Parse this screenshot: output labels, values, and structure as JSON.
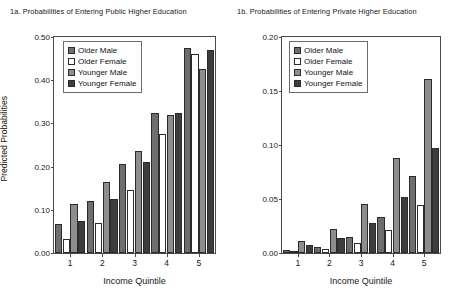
{
  "figure": {
    "xlabel": "Income Quintile",
    "ylabel": "Predicted Probabilities"
  },
  "legend": {
    "entries": [
      {
        "label": "Older Male",
        "fill": "#6e6e6e"
      },
      {
        "label": "Older Female",
        "fill": "#ffffff"
      },
      {
        "label": "Younger Male",
        "fill": "#8e8e8e"
      },
      {
        "label": "Younger Female",
        "fill": "#3d3d3d"
      }
    ]
  },
  "chart_data": [
    {
      "type": "bar",
      "title": "1a. Probabilities of Entering Public Higher Education",
      "xlabel": "Income Quintile",
      "ylabel": "Predicted Probabilities",
      "categories": [
        "1",
        "2",
        "3",
        "4",
        "5"
      ],
      "yticks": [
        "0.00",
        "0.10",
        "0.20",
        "0.30",
        "0.40",
        "0.50"
      ],
      "ylim": [
        0.0,
        0.5
      ],
      "grid": false,
      "legend_position": "upper left",
      "series": [
        {
          "name": "Older Male",
          "values": [
            0.068,
            0.12,
            0.205,
            0.325,
            0.475
          ]
        },
        {
          "name": "Older Female",
          "values": [
            0.033,
            0.07,
            0.145,
            0.275,
            0.46
          ]
        },
        {
          "name": "Younger Male",
          "values": [
            0.113,
            0.165,
            0.235,
            0.32,
            0.425
          ]
        },
        {
          "name": "Younger Female",
          "values": [
            0.073,
            0.125,
            0.21,
            0.325,
            0.47
          ]
        }
      ]
    },
    {
      "type": "bar",
      "title": "1b. Probabilities of Entering Private Higher Education",
      "xlabel": "Income Quintile",
      "ylabel": "",
      "categories": [
        "1",
        "2",
        "3",
        "4",
        "5"
      ],
      "yticks": [
        "0.00",
        "0.05",
        "0.10",
        "0.15",
        "0.20"
      ],
      "ylim": [
        0.0,
        0.2
      ],
      "grid": false,
      "legend_position": "upper left",
      "series": [
        {
          "name": "Older Male",
          "values": [
            0.003,
            0.006,
            0.015,
            0.033,
            0.071
          ]
        },
        {
          "name": "Older Female",
          "values": [
            0.001,
            0.004,
            0.009,
            0.021,
            0.044
          ]
        },
        {
          "name": "Younger Male",
          "values": [
            0.011,
            0.022,
            0.045,
            0.088,
            0.161
          ]
        },
        {
          "name": "Younger Female",
          "values": [
            0.007,
            0.014,
            0.028,
            0.052,
            0.097
          ]
        }
      ]
    }
  ]
}
